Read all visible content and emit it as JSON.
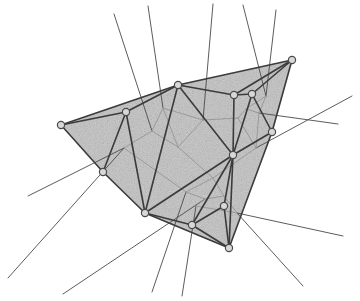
{
  "figure": {
    "type": "geometry-diagram",
    "width": 360,
    "height": 301,
    "background_color": "#ffffff",
    "hull_fill_color": "#c9c9c9",
    "hull_fill_opacity": 0.95,
    "delaunay_edge_color": "#3b3b3b",
    "delaunay_edge_width": 1.6,
    "voronoi_edge_color": "#9a9a9a",
    "voronoi_edge_width": 1.0,
    "voronoi_ray_color": "#4a4a4a",
    "voronoi_ray_width": 0.9,
    "vertex_fill_color": "#d8d8d8",
    "vertex_stroke_color": "#4a4a4a",
    "vertex_radius": 3.6,
    "texture": "speckled-noise"
  },
  "chart_data": {
    "type": "scatter",
    "xlabel": "",
    "ylabel": "",
    "xlim": [
      0,
      360
    ],
    "ylim": [
      0,
      301
    ],
    "grid": false,
    "legend": null,
    "sites": [
      {
        "id": "v0",
        "label": "left-apex",
        "x": 61,
        "y": 125
      },
      {
        "id": "v1",
        "label": "upper-left-hub",
        "x": 126,
        "y": 112
      },
      {
        "id": "v2",
        "label": "upper-mid",
        "x": 178,
        "y": 85
      },
      {
        "id": "v3",
        "label": "upper-right-inner",
        "x": 234,
        "y": 95
      },
      {
        "id": "v4",
        "label": "upper-right-small",
        "x": 252,
        "y": 94
      },
      {
        "id": "v5",
        "label": "top-right-apex",
        "x": 292,
        "y": 60
      },
      {
        "id": "v6",
        "label": "right-mid",
        "x": 272,
        "y": 132
      },
      {
        "id": "v7",
        "label": "center-hub",
        "x": 233,
        "y": 155
      },
      {
        "id": "v8",
        "label": "left-lower",
        "x": 103,
        "y": 172
      },
      {
        "id": "v9",
        "label": "lower-left-hub",
        "x": 145,
        "y": 213
      },
      {
        "id": "v10",
        "label": "lower-mid",
        "x": 192,
        "y": 225
      },
      {
        "id": "v11",
        "label": "lower-right-inner",
        "x": 224,
        "y": 206
      },
      {
        "id": "v12",
        "label": "bottom-apex",
        "x": 229,
        "y": 248
      }
    ],
    "hull": [
      "v0",
      "v2",
      "v5",
      "v6",
      "v12",
      "v9",
      "v8"
    ],
    "delaunay_edges": [
      [
        "v0",
        "v1"
      ],
      [
        "v0",
        "v2"
      ],
      [
        "v0",
        "v8"
      ],
      [
        "v1",
        "v2"
      ],
      [
        "v1",
        "v8"
      ],
      [
        "v1",
        "v9"
      ],
      [
        "v2",
        "v3"
      ],
      [
        "v2",
        "v5"
      ],
      [
        "v2",
        "v7"
      ],
      [
        "v2",
        "v9"
      ],
      [
        "v3",
        "v4"
      ],
      [
        "v3",
        "v5"
      ],
      [
        "v3",
        "v7"
      ],
      [
        "v4",
        "v5"
      ],
      [
        "v4",
        "v6"
      ],
      [
        "v4",
        "v7"
      ],
      [
        "v5",
        "v6"
      ],
      [
        "v6",
        "v7"
      ],
      [
        "v6",
        "v12"
      ],
      [
        "v7",
        "v9"
      ],
      [
        "v7",
        "v10"
      ],
      [
        "v7",
        "v11"
      ],
      [
        "v7",
        "v12"
      ],
      [
        "v8",
        "v9"
      ],
      [
        "v9",
        "v10"
      ],
      [
        "v9",
        "v12"
      ],
      [
        "v10",
        "v11"
      ],
      [
        "v10",
        "v12"
      ],
      [
        "v11",
        "v12"
      ]
    ],
    "voronoi_vertices": [
      {
        "id": "c0",
        "x": 124,
        "y": 148
      },
      {
        "id": "c1",
        "x": 152,
        "y": 131
      },
      {
        "id": "c2",
        "x": 178,
        "y": 147
      },
      {
        "id": "c3",
        "x": 203,
        "y": 120
      },
      {
        "id": "c4",
        "x": 238,
        "y": 118
      },
      {
        "id": "c5",
        "x": 246,
        "y": 109
      },
      {
        "id": "c6",
        "x": 259,
        "y": 113
      },
      {
        "id": "c7",
        "x": 266,
        "y": 96
      },
      {
        "id": "c8",
        "x": 256,
        "y": 148
      },
      {
        "id": "c9",
        "x": 213,
        "y": 178
      },
      {
        "id": "c10",
        "x": 186,
        "y": 192
      },
      {
        "id": "c11",
        "x": 205,
        "y": 199
      },
      {
        "id": "c12",
        "x": 224,
        "y": 196
      },
      {
        "id": "c13",
        "x": 237,
        "y": 213
      },
      {
        "id": "c14",
        "x": 163,
        "y": 108
      },
      {
        "id": "c15",
        "x": 196,
        "y": 206
      }
    ],
    "voronoi_internal_edges": [
      [
        "c0",
        "c1"
      ],
      [
        "c1",
        "c14"
      ],
      [
        "c14",
        "c2"
      ],
      [
        "c1",
        "c2"
      ],
      [
        "c2",
        "c3"
      ],
      [
        "c3",
        "c4"
      ],
      [
        "c4",
        "c5"
      ],
      [
        "c5",
        "c6"
      ],
      [
        "c5",
        "c7"
      ],
      [
        "c6",
        "c7"
      ],
      [
        "c6",
        "c8"
      ],
      [
        "c4",
        "c8"
      ],
      [
        "c8",
        "c9"
      ],
      [
        "c2",
        "c9"
      ],
      [
        "c9",
        "c10"
      ],
      [
        "c10",
        "c11"
      ],
      [
        "c11",
        "c12"
      ],
      [
        "c12",
        "c13"
      ],
      [
        "c9",
        "c12"
      ],
      [
        "c0",
        "c10"
      ],
      [
        "c11",
        "c15"
      ],
      [
        "c15",
        "c13"
      ],
      [
        "c3",
        "c14"
      ]
    ],
    "voronoi_rays": [
      {
        "from": "c0",
        "to_x": 28,
        "to_y": 196
      },
      {
        "from": "c0",
        "to_x": 8,
        "to_y": 278
      },
      {
        "from": "c1",
        "to_x": 114,
        "to_y": 14
      },
      {
        "from": "c14",
        "to_x": 148,
        "to_y": 6
      },
      {
        "from": "c3",
        "to_x": 213,
        "to_y": 4
      },
      {
        "from": "c7",
        "to_x": 243,
        "to_y": 5
      },
      {
        "from": "c7",
        "to_x": 276,
        "to_y": 10
      },
      {
        "from": "c6",
        "to_x": 338,
        "to_y": 124
      },
      {
        "from": "c8",
        "to_x": 352,
        "to_y": 96
      },
      {
        "from": "c13",
        "to_x": 343,
        "to_y": 236
      },
      {
        "from": "c13",
        "to_x": 303,
        "to_y": 286
      },
      {
        "from": "c10",
        "to_x": 152,
        "to_y": 292
      },
      {
        "from": "c15",
        "to_x": 182,
        "to_y": 296
      },
      {
        "from": "c11",
        "to_x": 63,
        "to_y": 294
      }
    ],
    "counts": {
      "sites": 13,
      "delaunay_edges": 29,
      "voronoi_vertices": 16,
      "voronoi_internal_edges": 23,
      "voronoi_unbounded_rays": 14
    }
  }
}
